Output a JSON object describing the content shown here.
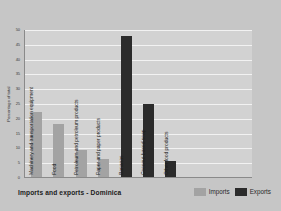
{
  "chart_data": {
    "type": "bar",
    "title": "Imports and exports - Dominica",
    "xlabel": "",
    "ylabel": "Percentage of total",
    "ylim": [
      0,
      50
    ],
    "ytick_step": 5,
    "yticks": [
      "50",
      "45",
      "40",
      "35",
      "30",
      "25",
      "20",
      "15",
      "10",
      "5",
      "0"
    ],
    "grid": true,
    "legend_position": "bottom-right",
    "categories": [
      "Machinery and transportation equipment",
      "Food",
      "Petroleum and petroleum products",
      "Paper and paper products",
      "Bananas",
      "Coconut-based soap",
      "Other food products"
    ],
    "series": [
      {
        "name": "Imports",
        "color": "#a3a3a3",
        "values": [
          22,
          18,
          9,
          6,
          null,
          null,
          null
        ]
      },
      {
        "name": "Exports",
        "color": "#2b2b2b",
        "values": [
          null,
          null,
          null,
          null,
          47.5,
          24.5,
          5.5
        ]
      }
    ],
    "bars": [
      {
        "category": "Machinery and transportation equipment",
        "series": "Imports",
        "value": 22
      },
      {
        "category": "Food",
        "series": "Imports",
        "value": 18
      },
      {
        "category": "Petroleum and petroleum products",
        "series": "Imports",
        "value": 9
      },
      {
        "category": "Paper and paper products",
        "series": "Imports",
        "value": 6
      },
      {
        "category": "Bananas",
        "series": "Exports",
        "value": 47.5
      },
      {
        "category": "Coconut-based soap",
        "series": "Exports",
        "value": 24.5
      },
      {
        "category": "Other food products",
        "series": "Exports",
        "value": 5.5
      }
    ]
  },
  "legend": {
    "imports_label": "Imports",
    "exports_label": "Exports"
  },
  "colors": {
    "imports": "#a3a3a3",
    "exports": "#2b2b2b",
    "figure_background": "#c6c6c6",
    "plot_background": "#d2d2d2",
    "gridline": "#f2f2f2"
  }
}
